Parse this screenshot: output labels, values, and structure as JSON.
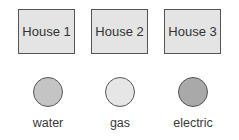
{
  "houses": [
    {
      "label": "House 1"
    },
    {
      "label": "House 2"
    },
    {
      "label": "House 3"
    }
  ],
  "utilities": [
    {
      "label": "water",
      "color": "#c4c4c4"
    },
    {
      "label": "gas",
      "color": "#e6e6e6"
    },
    {
      "label": "electric",
      "color": "#a9a9a9"
    }
  ]
}
